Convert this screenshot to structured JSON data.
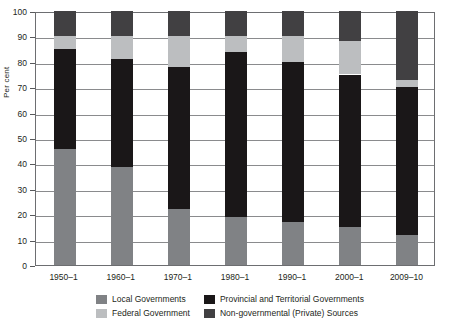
{
  "chart_data": {
    "type": "bar",
    "stacked": true,
    "title": "",
    "xlabel": "",
    "ylabel": "Per cent",
    "ylim": [
      0,
      100
    ],
    "ytick_step": 10,
    "grid": true,
    "legend_position": "bottom",
    "categories": [
      "1950–1",
      "1960–1",
      "1970–1",
      "1980–1",
      "1990–1",
      "2000–1",
      "2009–10"
    ],
    "yticks": [
      "0",
      "10",
      "20",
      "30",
      "40",
      "50",
      "60",
      "70",
      "80",
      "90",
      "100"
    ],
    "series": [
      {
        "name": "Local Governments",
        "color": "#808285",
        "values": [
          45.5,
          38.5,
          22.0,
          19.0,
          17.0,
          15.0,
          12.0
        ]
      },
      {
        "name": "Provincial and Territorial Governments",
        "color": "#1a1718",
        "values": [
          39.5,
          42.5,
          56.0,
          65.0,
          63.0,
          60.0,
          58.0
        ]
      },
      {
        "name": "Federal Government",
        "color": "#bcbec0",
        "values": [
          5.0,
          9.0,
          12.0,
          6.0,
          10.0,
          13.0,
          3.0
        ]
      },
      {
        "name": "Non-governmental (Private) Sources",
        "color": "#414042",
        "values": [
          10.0,
          10.0,
          10.0,
          10.0,
          10.0,
          12.0,
          27.0
        ]
      }
    ]
  },
  "legend": {
    "items": [
      {
        "label": "Local Governments",
        "color": "#808285"
      },
      {
        "label": "Provincial and Territorial Governments",
        "color": "#1a1718"
      },
      {
        "label": "Federal Government",
        "color": "#bcbec0"
      },
      {
        "label": "Non-governmental (Private) Sources",
        "color": "#414042"
      }
    ]
  }
}
